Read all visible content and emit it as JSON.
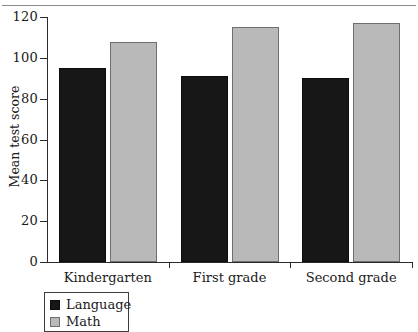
{
  "chart_data": {
    "type": "bar",
    "title": "",
    "xlabel": "",
    "ylabel": "Mean test score",
    "ylim": [
      0,
      120
    ],
    "yticks": [
      0,
      20,
      40,
      60,
      80,
      100,
      120
    ],
    "ytick_labels": [
      "0",
      "20",
      "40",
      "60",
      "80",
      "100",
      "120"
    ],
    "grid": false,
    "legend_position": "bottom-left",
    "categories": [
      "Kindergarten",
      "First grade",
      "Second grade"
    ],
    "series": [
      {
        "name": "Language",
        "color": "#171717",
        "values": [
          95,
          91,
          90
        ]
      },
      {
        "name": "Math",
        "color": "#b9b9b9",
        "values": [
          108,
          115,
          117
        ]
      }
    ]
  },
  "legend": {
    "entries": [
      {
        "label": "Language",
        "swatch": "language"
      },
      {
        "label": "Math",
        "swatch": "math"
      }
    ]
  }
}
